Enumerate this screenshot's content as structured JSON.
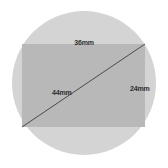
{
  "figure": {
    "canvas": {
      "width": 168,
      "height": 168,
      "background_color": "#ffffff"
    },
    "circle": {
      "name": "circle-shape",
      "center_x": 84,
      "center_y": 83,
      "radius": 72,
      "fill_color": "#d4d4d4"
    },
    "rectangle": {
      "name": "rectangle-shape",
      "x": 22,
      "y": 44,
      "width": 123,
      "height": 83,
      "fill_color": "#b8b8b8"
    },
    "diagonal": {
      "name": "diagonal-line",
      "x1": 22,
      "y1": 127,
      "x2": 145,
      "y2": 44,
      "stroke_color": "#4a4a4a",
      "stroke_width": 1
    },
    "labels": {
      "top": {
        "text": "36mm",
        "x": 84,
        "y": 45
      },
      "right": {
        "text": "24mm",
        "x": 130,
        "y": 91
      },
      "diagonal": {
        "text": "44mm",
        "x": 52,
        "y": 95
      }
    }
  }
}
